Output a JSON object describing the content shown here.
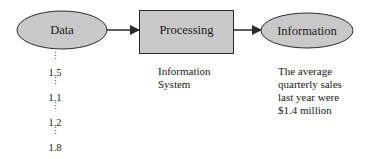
{
  "nodes": {
    "data": {
      "label": "Data",
      "shape": "ellipse"
    },
    "processing": {
      "label": "Processing",
      "shape": "rectangle"
    },
    "information": {
      "label": "Information",
      "shape": "ellipse"
    }
  },
  "data_values": [
    "1.5",
    "1.1",
    "1.2",
    "1.8"
  ],
  "ellipsis_glyph": "⋮",
  "captions": {
    "processing": [
      "Information",
      "System"
    ],
    "information": [
      "The average",
      "quarterly sales",
      "last year were",
      "$1.4 million"
    ]
  },
  "colors": {
    "node_fill": "#c9c9c9",
    "stroke": "#2a2a2a",
    "background": "#ffffff"
  }
}
